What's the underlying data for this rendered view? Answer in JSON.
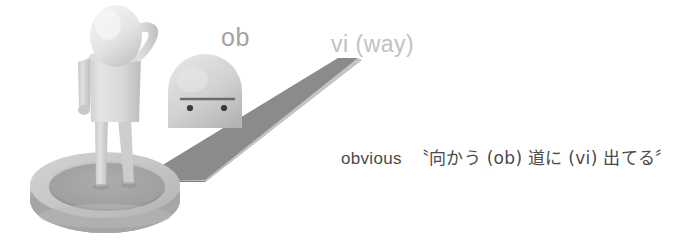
{
  "canvas": {
    "width": 689,
    "height": 245,
    "background": "#ffffff"
  },
  "labels": {
    "ob": "ob",
    "vi": "vi (way)"
  },
  "caption": {
    "english": "obvious",
    "japanese": "〝向かう (ob) 道に (vi) 出てる〞",
    "full": "obvious 〝向かう (ob) 道に (vi) 出てる〞"
  },
  "colors": {
    "background": "#ffffff",
    "label_ob": "#a3a3a3",
    "label_vi": "#c2c2c2",
    "caption_text": "#4a4a4a",
    "road_top": "#8a8a8a",
    "road_side": "#b9b9b9",
    "figure_body": "#d9d9d9",
    "figure_shade": "#bdbdbd",
    "head_light": "#ededed",
    "disc_top": "#c9c9c9",
    "disc_rim": "#ababab",
    "disc_inner": "#9e9e9e",
    "robot_dome": "#cfcfcf",
    "robot_face_line": "#6b6b6b",
    "robot_eye": "#3c3c3c"
  },
  "scene": {
    "figure_name": "standing-figure-scratching-head",
    "robot_name": "dome-head-robot",
    "road_name": "road-wedge",
    "platform_name": "circular-disc-platform"
  }
}
